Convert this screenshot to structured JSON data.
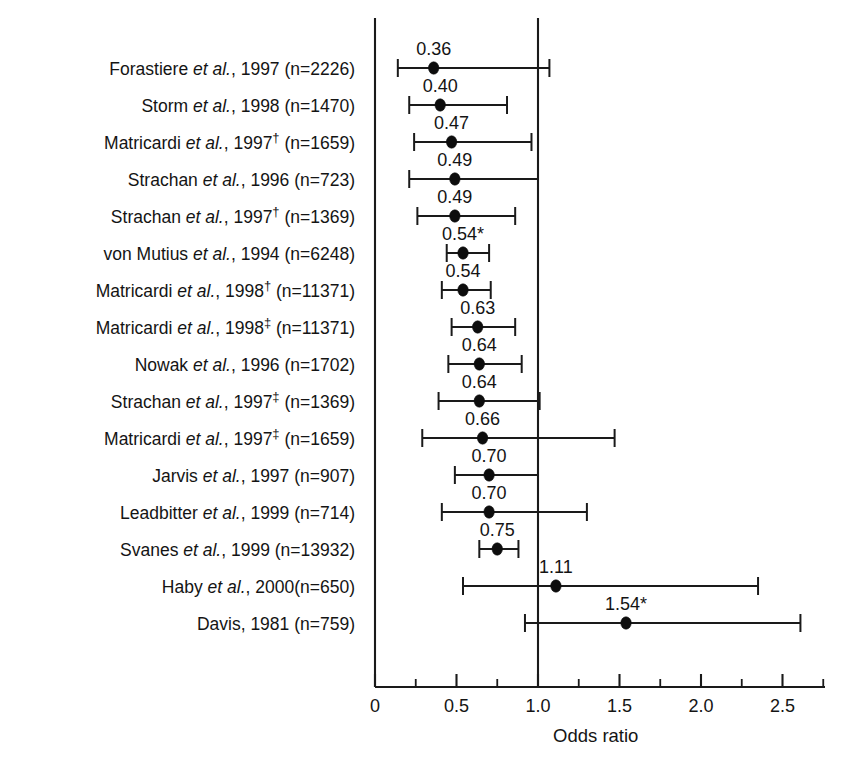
{
  "figure": {
    "axis_title": "Odds ratio",
    "tick_labels": [
      "0",
      "0.5",
      "1.0",
      "1.5",
      "2.0",
      "2.5"
    ],
    "reference_value": "1.0"
  },
  "chart_data": {
    "type": "scatter",
    "title": "",
    "xlabel": "Odds ratio",
    "ylabel": "",
    "xlim": [
      0,
      2.75
    ],
    "xticks": [
      0,
      0.5,
      1.0,
      1.5,
      2.0,
      2.5
    ],
    "xtick_labels": [
      "0",
      "0.5",
      "1.0",
      "1.5",
      "2.0",
      "2.5"
    ],
    "xminorticks": [
      0.25,
      0.75,
      1.25,
      1.75,
      2.25,
      2.75
    ],
    "grid": false,
    "legend": "none",
    "reference_line": 1.0,
    "orientation": "horizontal-forest-plot",
    "points": [
      {
        "label": "Forastiere et al., 1997 (n=2226)",
        "author": "Forastiere",
        "suffix": "",
        "year": "1997",
        "n": "2226",
        "value": 0.36,
        "value_label": "0.36",
        "ci_low": 0.14,
        "ci_high": 1.07,
        "significant": false
      },
      {
        "label": "Storm et al., 1998 (n=1470)",
        "author": "Storm",
        "suffix": "",
        "year": "1998",
        "n": "1470",
        "value": 0.4,
        "value_label": "0.40",
        "ci_low": 0.21,
        "ci_high": 0.81,
        "significant": false
      },
      {
        "label": "Matricardi et al., 1997† (n=1659)",
        "author": "Matricardi",
        "suffix": "†",
        "year": "1997",
        "n": "1659",
        "value": 0.47,
        "value_label": "0.47",
        "ci_low": 0.24,
        "ci_high": 0.96,
        "significant": false
      },
      {
        "label": "Strachan et al., 1996 (n=723)",
        "author": "Strachan",
        "suffix": "",
        "year": "1996",
        "n": "723",
        "value": 0.49,
        "value_label": "0.49",
        "ci_low": 0.21,
        "ci_high": 1.0,
        "significant": false
      },
      {
        "label": "Strachan et al., 1997† (n=1369)",
        "author": "Strachan",
        "suffix": "†",
        "year": "1997",
        "n": "1369",
        "value": 0.49,
        "value_label": "0.49",
        "ci_low": 0.26,
        "ci_high": 0.86,
        "significant": false
      },
      {
        "label": "von Mutius et al., 1994 (n=6248)",
        "author": "von Mutius",
        "suffix": "",
        "year": "1994",
        "n": "6248",
        "value": 0.54,
        "value_label": "0.54*",
        "ci_low": 0.44,
        "ci_high": 0.7,
        "significant": true
      },
      {
        "label": "Matricardi et al., 1998† (n=11371)",
        "author": "Matricardi",
        "suffix": "†",
        "year": "1998",
        "n": "11371",
        "value": 0.54,
        "value_label": "0.54",
        "ci_low": 0.41,
        "ci_high": 0.71,
        "significant": false
      },
      {
        "label": "Matricardi et al., 1998‡ (n=11371)",
        "author": "Matricardi",
        "suffix": "‡",
        "year": "1998",
        "n": "11371",
        "value": 0.63,
        "value_label": "0.63",
        "ci_low": 0.47,
        "ci_high": 0.86,
        "significant": false
      },
      {
        "label": "Nowak et al., 1996 (n=1702)",
        "author": "Nowak",
        "suffix": "",
        "year": "1996",
        "n": "1702",
        "value": 0.64,
        "value_label": "0.64",
        "ci_low": 0.45,
        "ci_high": 0.9,
        "significant": false
      },
      {
        "label": "Strachan et al., 1997‡ (n=1369)",
        "author": "Strachan",
        "suffix": "‡",
        "year": "1997",
        "n": "1369",
        "value": 0.64,
        "value_label": "0.64",
        "ci_low": 0.39,
        "ci_high": 1.01,
        "significant": false
      },
      {
        "label": "Matricardi et al., 1997‡ (n=1659)",
        "author": "Matricardi",
        "suffix": "‡",
        "year": "1997",
        "n": "1659",
        "value": 0.66,
        "value_label": "0.66",
        "ci_low": 0.29,
        "ci_high": 1.47,
        "significant": false
      },
      {
        "label": "Jarvis et al., 1997 (n=907)",
        "author": "Jarvis",
        "suffix": "",
        "year": "1997",
        "n": "907",
        "value": 0.7,
        "value_label": "0.70",
        "ci_low": 0.49,
        "ci_high": 1.0,
        "significant": false
      },
      {
        "label": "Leadbitter et al., 1999 (n=714)",
        "author": "Leadbitter",
        "suffix": "",
        "year": "1999",
        "n": "714",
        "value": 0.7,
        "value_label": "0.70",
        "ci_low": 0.41,
        "ci_high": 1.3,
        "significant": false
      },
      {
        "label": "Svanes et al., 1999 (n=13932)",
        "author": "Svanes",
        "suffix": "",
        "year": "1999",
        "n": "13932",
        "value": 0.75,
        "value_label": "0.75",
        "ci_low": 0.64,
        "ci_high": 0.88,
        "significant": false
      },
      {
        "label": "Haby et al., 2000(n=650)",
        "author": "Haby",
        "suffix": "",
        "year": "2000",
        "n": "650",
        "value": 1.11,
        "value_label": "1.11",
        "ci_low": 0.54,
        "ci_high": 2.35,
        "significant": false
      },
      {
        "label": "Davis, 1981 (n=759)",
        "author": "Davis",
        "suffix": "",
        "year": "1981",
        "n": "759",
        "value": 1.54,
        "value_label": "1.54*",
        "ci_low": 0.92,
        "ci_high": 2.61,
        "significant": true
      }
    ]
  }
}
